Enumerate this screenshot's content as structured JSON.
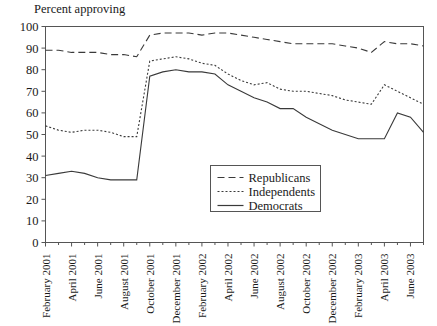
{
  "chart_data": {
    "type": "line",
    "title": "Percent approving",
    "xlabel": "",
    "ylabel": "",
    "ylim": [
      0,
      100
    ],
    "ytick_step": 10,
    "yticks": [
      0,
      10,
      20,
      30,
      40,
      50,
      60,
      70,
      80,
      90,
      100
    ],
    "grid": false,
    "legend_position": "inside-center-right",
    "x": [
      "February 2001",
      "March 2001",
      "April 2001",
      "May 2001",
      "June 2001",
      "July 2001",
      "August 2001",
      "September 2001",
      "October 2001",
      "November 2001",
      "December 2001",
      "January 2002",
      "February 2002",
      "March 2002",
      "April 2002",
      "May 2002",
      "June 2002",
      "July 2002",
      "August 2002",
      "September 2002",
      "October 2002",
      "November 2002",
      "December 2002",
      "January 2003",
      "February 2003",
      "March 2003",
      "April 2003",
      "May 2003",
      "June 2003",
      "July 2003"
    ],
    "xtick_labels": [
      "February 2001",
      "April 2001",
      "June 2001",
      "August 2001",
      "October 2001",
      "December 2001",
      "February 2002",
      "April 2002",
      "June 2002",
      "August 2002",
      "October 2002",
      "December 2002",
      "February 2003",
      "April 2003",
      "June 2003"
    ],
    "xtick_indices": [
      0,
      2,
      4,
      6,
      8,
      10,
      12,
      14,
      16,
      18,
      20,
      22,
      24,
      26,
      28
    ],
    "series": [
      {
        "name": "Republicans",
        "style": "dashed",
        "values": [
          89,
          89,
          88,
          88,
          88,
          87,
          87,
          86,
          96,
          97,
          97,
          97,
          96,
          97,
          97,
          96,
          95,
          94,
          93,
          92,
          92,
          92,
          92,
          91,
          90,
          88,
          93,
          92,
          92,
          91
        ]
      },
      {
        "name": "Independents",
        "style": "dotted",
        "values": [
          54,
          52,
          51,
          52,
          52,
          51,
          49,
          49,
          84,
          85,
          86,
          85,
          83,
          82,
          78,
          75,
          73,
          74,
          71,
          70,
          70,
          69,
          68,
          66,
          65,
          64,
          73,
          70,
          67,
          64
        ]
      },
      {
        "name": "Democrats",
        "style": "solid",
        "values": [
          31,
          32,
          33,
          32,
          30,
          29,
          29,
          29,
          77,
          79,
          80,
          79,
          79,
          78,
          73,
          70,
          67,
          65,
          62,
          62,
          58,
          55,
          52,
          50,
          48,
          48,
          48,
          60,
          58,
          51
        ]
      }
    ],
    "note": "Presidential approval by party identification, February 2001 through July 2003"
  },
  "legend": {
    "items": [
      {
        "label": "Republicans",
        "style": "dashed"
      },
      {
        "label": "Independents",
        "style": "dotted"
      },
      {
        "label": "Democrats",
        "style": "solid"
      }
    ]
  }
}
